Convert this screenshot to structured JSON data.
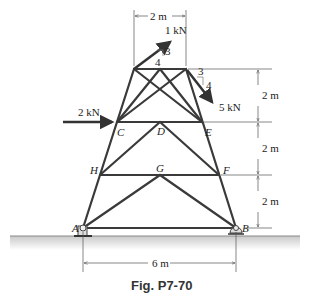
{
  "figure": {
    "caption": "Fig. P7-70",
    "colors": {
      "member": "#3a3a3a",
      "dim": "#555555",
      "ground": "#bdbdbd"
    },
    "nodes": {
      "A": "A",
      "B": "B",
      "C": "C",
      "D": "D",
      "E": "E",
      "F": "F",
      "G": "G",
      "H": "H"
    },
    "loads": {
      "top_force": "1 kN",
      "top_slope_rise": "3",
      "top_slope_run": "4",
      "right_force": "5 kN",
      "right_slope_run": "3",
      "right_slope_rise": "4",
      "left_force": "2 kN"
    },
    "dimensions": {
      "top_width": "2 m",
      "height_1": "2 m",
      "height_2": "2 m",
      "height_3": "2 m",
      "base_width": "6 m"
    }
  }
}
